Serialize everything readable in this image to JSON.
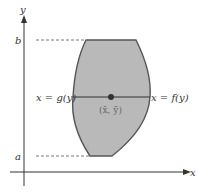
{
  "figure": {
    "axes": {
      "x_label": "x",
      "y_label": "y"
    },
    "levels": {
      "bottom": "a",
      "top": "b"
    },
    "curves": {
      "left": "x = g(y)",
      "right": "x = f(y)"
    },
    "centroid": "(x̄, ȳ)",
    "colors": {
      "region_fill": "#b9b9b9",
      "outline": "#555555",
      "axis": "#333333"
    }
  }
}
